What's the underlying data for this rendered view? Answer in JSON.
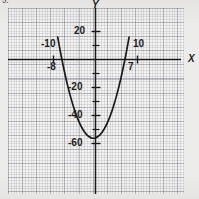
{
  "problem": {
    "number_label": "5."
  },
  "chart_data": {
    "type": "line",
    "title": "",
    "subtitle": "",
    "xlabel": "X",
    "ylabel": "Y",
    "xlim": [
      -13,
      12
    ],
    "ylim": [
      -72,
      30
    ],
    "grid": true,
    "grid_style": "graph-paper",
    "legend": null,
    "axis_labels": {
      "x_axis_name": "X",
      "y_axis_name": "Y"
    },
    "x_tick_labels": [
      {
        "value": -10,
        "text": "-10",
        "position": "above-axis"
      },
      {
        "value": 10,
        "text": "10",
        "position": "above-axis"
      }
    ],
    "y_tick_labels": [
      {
        "value": 20,
        "text": "20"
      },
      {
        "value": -20,
        "text": "-20"
      },
      {
        "value": -40,
        "text": "-40"
      },
      {
        "value": -60,
        "text": "-60"
      }
    ],
    "annotations": [
      {
        "text": "-8",
        "kind": "x-intercept",
        "x": -8,
        "y": 0
      },
      {
        "text": "7",
        "kind": "x-intercept",
        "x": 7,
        "y": 0
      }
    ],
    "curve": {
      "name": "parabola",
      "shape": "upward-parabola",
      "roots": [
        -8,
        7
      ],
      "vertex": {
        "x": -0.5,
        "y": -56.25
      },
      "equation": "y = (x + 8)(x - 7)",
      "points": [
        {
          "x": -9.0,
          "y": 16.0
        },
        {
          "x": -8.5,
          "y": 7.75
        },
        {
          "x": -8.0,
          "y": 0.0
        },
        {
          "x": -7.0,
          "y": -14.0
        },
        {
          "x": -6.0,
          "y": -26.0
        },
        {
          "x": -5.0,
          "y": -36.0
        },
        {
          "x": -4.0,
          "y": -44.0
        },
        {
          "x": -3.0,
          "y": -50.0
        },
        {
          "x": -2.0,
          "y": -54.0
        },
        {
          "x": -1.0,
          "y": -56.0
        },
        {
          "x": -0.5,
          "y": -56.25
        },
        {
          "x": 0.0,
          "y": -56.0
        },
        {
          "x": 1.0,
          "y": -54.0
        },
        {
          "x": 2.0,
          "y": -50.0
        },
        {
          "x": 3.0,
          "y": -44.0
        },
        {
          "x": 4.0,
          "y": -36.0
        },
        {
          "x": 5.0,
          "y": -26.0
        },
        {
          "x": 6.0,
          "y": -14.0
        },
        {
          "x": 7.0,
          "y": 0.0
        },
        {
          "x": 7.5,
          "y": 7.75
        },
        {
          "x": 8.0,
          "y": 16.0
        }
      ]
    },
    "colors": {
      "curve": "#1a1a1a",
      "axis": "#1a1a1a",
      "grid_major": "#787d87",
      "grid_minor": "#8c919b",
      "paper": "#f4f3f2",
      "page": "#eeeceb",
      "text": "#1d1d1d"
    }
  }
}
